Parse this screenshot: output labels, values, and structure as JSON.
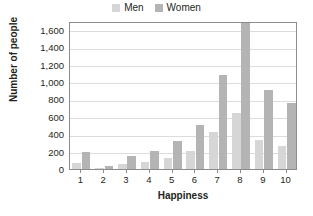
{
  "legend": {
    "position": "top-center",
    "entries": [
      {
        "label": "Men",
        "color": "#d6d6d6",
        "swatch_icon": "square-swatch-icon"
      },
      {
        "label": "Women",
        "color": "#b4b4b4",
        "swatch_icon": "square-swatch-icon"
      }
    ]
  },
  "chart_data": {
    "type": "bar",
    "title": "",
    "subtitle": "",
    "xlabel": "Happiness",
    "ylabel": "Number of people",
    "categories": [
      "1",
      "2",
      "3",
      "4",
      "5",
      "6",
      "7",
      "8",
      "9",
      "10"
    ],
    "series": [
      {
        "name": "Men",
        "color": "#d6d6d6",
        "values": [
          70,
          10,
          55,
          85,
          130,
          210,
          425,
          645,
          330,
          270
        ]
      },
      {
        "name": "Women",
        "color": "#b4b4b4",
        "values": [
          200,
          40,
          145,
          210,
          320,
          505,
          1085,
          1680,
          910,
          760
        ]
      }
    ],
    "ylim": [
      0,
      1700
    ],
    "yticks": [
      0,
      200,
      400,
      600,
      800,
      1000,
      1200,
      1400,
      1600
    ],
    "ytick_labels": [
      "0",
      "200",
      "400",
      "600",
      "800",
      "1,000",
      "1,200",
      "1,400",
      "1,600"
    ],
    "grid": true,
    "grid_axis": "y",
    "grid_color": "#dcdcdc",
    "legend_position": "top-center",
    "axis_color": "#8c8c8c",
    "background": "#ffffff"
  }
}
